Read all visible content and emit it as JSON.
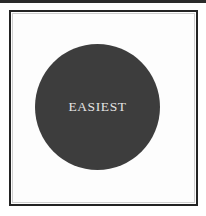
{
  "figure": {
    "background_color": "#ffffff",
    "frame": {
      "border_color": "#232323",
      "fill_color": "#fdfdfd"
    },
    "disc": {
      "label": "EASIEST",
      "fill_color": "#3d3d3d",
      "label_color": "#e4e4e4"
    }
  }
}
